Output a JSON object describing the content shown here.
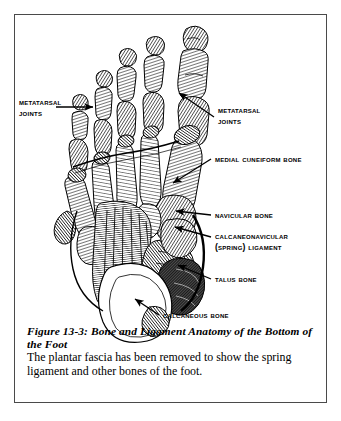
{
  "figure": {
    "caption_title": "Figure 13-3:  Bone and Ligament Anatomy of the Bottom of the Foot",
    "caption_body": "The plantar fascia has been removed to show the spring ligament and other bones of the foot.",
    "background_color": "#ffffff",
    "ink_color": "#000000",
    "frame_color": "#4a4a4a"
  },
  "labels": {
    "metatarsal_joints_left": {
      "line1": "Metatarsal",
      "line2": "Joints"
    },
    "metatarsal_joints_right": {
      "line1": "Metatarsal",
      "line2": "Joints"
    },
    "medial_cuneiform": {
      "line1": "Medial Cuneiform Bone"
    },
    "navicular": {
      "line1": "Navicular Bone"
    },
    "spring_ligament": {
      "line1": "Calcaneonavicular",
      "line2": "(Spring) Ligament"
    },
    "talus": {
      "line1": "Talus Bone"
    },
    "calcaneous": {
      "line1": "Calcaneous Bone"
    }
  },
  "illustration": {
    "subject": "bottom-of-foot-skeleton",
    "style": "black-and-white engraving hatching"
  }
}
